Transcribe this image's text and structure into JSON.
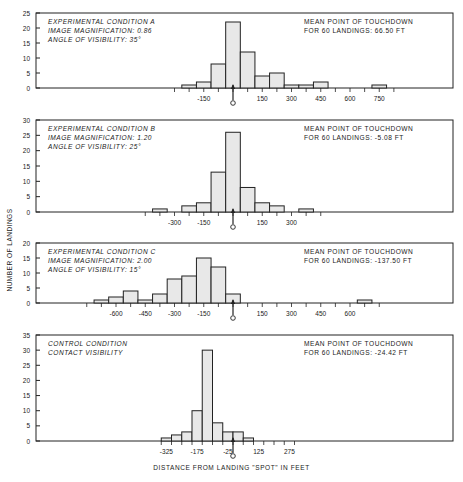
{
  "figure": {
    "y_axis_label": "NUMBER OF LANDINGS",
    "x_axis_label": "DISTANCE FROM LANDING \"SPOT\" IN FEET",
    "colors": {
      "bar_fill": "#e8e8e8",
      "bar_stroke": "#222222",
      "axis": "#222222",
      "text": "#1a1a1a"
    }
  },
  "panels": [
    {
      "caption_lines": [
        "EXPERIMENTAL CONDITION A",
        "IMAGE MAGNIFICATION: 0.86",
        "ANGLE OF VISIBILITY: 35°"
      ],
      "mean_lines": [
        "MEAN POINT OF TOUCHDOWN",
        "FOR 60 LANDINGS: 66.50 FT"
      ]
    },
    {
      "caption_lines": [
        "EXPERIMENTAL CONDITION B",
        "IMAGE MAGNIFICATION: 1.20",
        "ANGLE OF VISIBILITY: 25°"
      ],
      "mean_lines": [
        "MEAN POINT OF TOUCHDOWN",
        "FOR 60 LANDINGS: -5.08 FT"
      ]
    },
    {
      "caption_lines": [
        "EXPERIMENTAL CONDITION C",
        "IMAGE MAGNIFICATION: 2.00",
        "ANGLE OF VISIBILITY: 15°"
      ],
      "mean_lines": [
        "MEAN POINT OF TOUCHDOWN",
        "FOR 60 LANDINGS: -137.50 FT"
      ]
    },
    {
      "caption_lines": [
        "CONTROL CONDITION",
        "CONTACT VISIBILITY"
      ],
      "mean_lines": [
        "MEAN POINT OF TOUCHDOWN",
        "FOR 60 LANDINGS: -24.42 FT"
      ]
    }
  ],
  "chart_data": [
    {
      "type": "bar",
      "title": "EXPERIMENTAL CONDITION A",
      "subtitle": "IMAGE MAGNIFICATION: 0.86; ANGLE OF VISIBILITY: 35°",
      "annotation": "MEAN POINT OF TOUCHDOWN FOR 60 LANDINGS: 66.50 FT",
      "xlabel": "DISTANCE FROM LANDING \"SPOT\" IN FEET",
      "ylabel": "NUMBER OF LANDINGS",
      "bin_width": 75,
      "x": [
        -225,
        -150,
        -75,
        0,
        75,
        150,
        225,
        300,
        375,
        450,
        525,
        600,
        675,
        750
      ],
      "values": [
        1,
        2,
        8,
        22,
        12,
        4,
        5,
        1,
        1,
        2,
        0,
        0,
        0,
        1
      ],
      "ylim": [
        0,
        25
      ],
      "yticks": [
        0,
        5,
        10,
        15,
        20,
        25
      ],
      "xtick_labels": [
        "-150",
        "150",
        "300",
        "450",
        "600",
        "750"
      ],
      "xtick_positions": [
        -150,
        150,
        300,
        450,
        600,
        750
      ],
      "xlim": [
        -1160,
        960
      ],
      "plot_box": {
        "top": 13,
        "height": 75
      },
      "zero_marker": true,
      "grid": false
    },
    {
      "type": "bar",
      "title": "EXPERIMENTAL CONDITION B",
      "subtitle": "IMAGE MAGNIFICATION: 1.20; ANGLE OF VISIBILITY: 25°",
      "annotation": "MEAN POINT OF TOUCHDOWN FOR 60 LANDINGS: -5.08 FT",
      "xlabel": "DISTANCE FROM LANDING \"SPOT\" IN FEET",
      "ylabel": "NUMBER OF LANDINGS",
      "bin_width": 75,
      "x": [
        -375,
        -300,
        -225,
        -150,
        -75,
        0,
        75,
        150,
        225,
        300,
        375
      ],
      "values": [
        1,
        0,
        2,
        3,
        13,
        26,
        8,
        3,
        2,
        0,
        1
      ],
      "ylim": [
        0,
        30
      ],
      "yticks": [
        0,
        5,
        10,
        15,
        20,
        25,
        30
      ],
      "xtick_labels": [
        "-300",
        "-150",
        "150",
        "300"
      ],
      "xtick_positions": [
        -300,
        -150,
        150,
        300
      ],
      "xlim": [
        -1160,
        960
      ],
      "plot_box": {
        "top": 120,
        "height": 92
      },
      "zero_marker": true,
      "grid": false
    },
    {
      "type": "bar",
      "title": "EXPERIMENTAL CONDITION C",
      "subtitle": "IMAGE MAGNIFICATION: 2.00; ANGLE OF VISIBILITY: 15°",
      "annotation": "MEAN POINT OF TOUCHDOWN FOR 60 LANDINGS: -137.50 FT",
      "xlabel": "DISTANCE FROM LANDING \"SPOT\" IN FEET",
      "ylabel": "NUMBER OF LANDINGS",
      "bin_width": 75,
      "x": [
        -675,
        -600,
        -525,
        -450,
        -375,
        -300,
        -225,
        -150,
        -75,
        0,
        75,
        150,
        225,
        300,
        375,
        450,
        525,
        600,
        675
      ],
      "values": [
        1,
        2,
        4,
        1,
        3,
        8,
        9,
        15,
        12,
        3,
        0,
        0,
        0,
        0,
        0,
        0,
        0,
        0,
        1
      ],
      "ylim": [
        0,
        20
      ],
      "yticks": [
        0,
        5,
        10,
        15,
        20
      ],
      "xtick_labels": [
        "-600",
        "-450",
        "-300",
        "-150",
        "150",
        "300",
        "450",
        "600"
      ],
      "xtick_positions": [
        -600,
        -450,
        -300,
        -150,
        150,
        300,
        450,
        600
      ],
      "xlim": [
        -1160,
        960
      ],
      "plot_box": {
        "top": 243,
        "height": 60
      },
      "zero_marker": true,
      "grid": false
    },
    {
      "type": "bar",
      "title": "CONTROL CONDITION",
      "subtitle": "CONTACT VISIBILITY",
      "annotation": "MEAN POINT OF TOUCHDOWN FOR 60 LANDINGS: -24.42 FT",
      "xlabel": "DISTANCE FROM LANDING \"SPOT\" IN FEET",
      "ylabel": "NUMBER OF LANDINGS",
      "bin_width": 50,
      "x": [
        -325,
        -275,
        -225,
        -175,
        -125,
        -75,
        -25,
        25,
        75,
        125,
        175,
        225,
        275
      ],
      "values": [
        1,
        2,
        3,
        10,
        30,
        6,
        3,
        3,
        1,
        0,
        0,
        0,
        0
      ],
      "ylim": [
        0,
        35
      ],
      "yticks": [
        0,
        5,
        10,
        15,
        20,
        25,
        30,
        35
      ],
      "xtick_labels": [
        "-325",
        "-175",
        "-25",
        "125",
        "275"
      ],
      "xtick_positions": [
        -325,
        -175,
        -25,
        125,
        275
      ],
      "xlim": [
        -780,
        640
      ],
      "plot_box": {
        "top": 335,
        "height": 106
      },
      "zero_marker": true,
      "grid": false
    }
  ]
}
